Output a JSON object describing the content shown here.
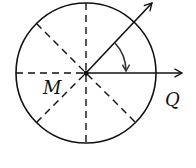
{
  "diagram": {
    "labels": {
      "center": "M",
      "direction": "Q"
    },
    "colors": {
      "stroke": "#111111",
      "curved_arrow": "#333333",
      "background": "#ffffff"
    },
    "elements": {
      "circle": "circle divided into 8 sectors by dashed diameters",
      "horizontal_arrow": "solid ray from M to right toward Q",
      "diagonal_arrow": "solid ray from M at 45° up-right",
      "rotation_arrow": "curved arrow from diagonal ray clockwise to horizontal ray"
    }
  }
}
